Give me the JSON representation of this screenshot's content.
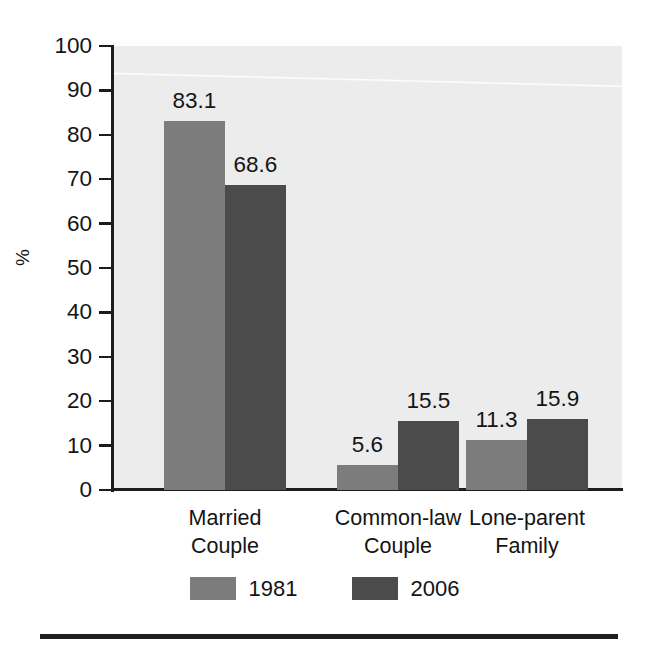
{
  "chart_data": {
    "type": "bar",
    "title": "",
    "subtitle": "",
    "xlabel": "",
    "ylabel": "%",
    "ylim": [
      0,
      100
    ],
    "yticks": [
      0,
      10,
      20,
      30,
      40,
      50,
      60,
      70,
      80,
      90,
      100
    ],
    "ytick_labels": [
      "0",
      "10",
      "20",
      "30",
      "40",
      "50",
      "60",
      "70",
      "80",
      "90",
      "100"
    ],
    "grid": false,
    "legend_position": "bottom",
    "categories": [
      "Married Couple",
      "Common-law Couple",
      "Lone-parent Family"
    ],
    "category_lines": [
      [
        "Married",
        "Couple"
      ],
      [
        "Common-law",
        "Couple"
      ],
      [
        "Lone-parent",
        "Family"
      ]
    ],
    "series": [
      {
        "name": "1981",
        "color": "#7c7c7c",
        "values": [
          83.1,
          5.6,
          11.3
        ]
      },
      {
        "name": "2006",
        "color": "#4b4b4b",
        "values": [
          68.6,
          15.5,
          15.9
        ]
      }
    ],
    "value_labels": [
      [
        "83.1",
        "5.6",
        "11.3"
      ],
      [
        "68.6",
        "15.5",
        "15.9"
      ]
    ],
    "annotations": []
  },
  "legend": {
    "items": [
      {
        "label": "1981",
        "color": "#7c7c7c"
      },
      {
        "label": "2006",
        "color": "#4b4b4b"
      }
    ]
  },
  "axis": {
    "y_title": "%"
  },
  "colors": {
    "plot_background": "#ececec",
    "page_background": "#ffffff",
    "axis": "#1c1c1c",
    "text": "#141414",
    "series_1981": "#7c7c7c",
    "series_2006": "#4b4b4b",
    "bottom_rule": "#1f1f1f"
  }
}
